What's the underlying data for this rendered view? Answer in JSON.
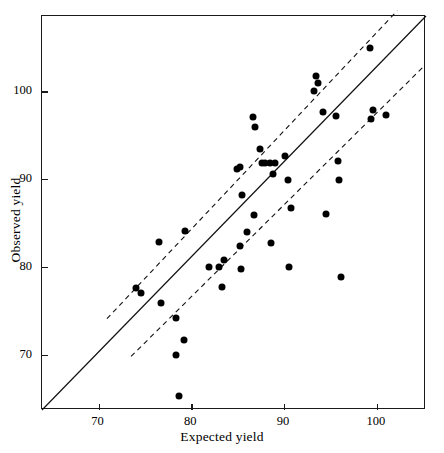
{
  "chart_data": {
    "type": "scatter",
    "title": "",
    "xlabel": "Expected yield",
    "ylabel": "Observed yield",
    "xlim": [
      63.9,
      105.3
    ],
    "ylim": [
      63.7,
      108.6
    ],
    "xticks": [
      70,
      80,
      90,
      100
    ],
    "yticks": [
      70,
      80,
      90,
      100
    ],
    "xticklabels": [
      "70",
      "80",
      "90",
      "100"
    ],
    "yticklabels": [
      "70",
      "80",
      "90",
      "100"
    ],
    "grid": false,
    "legend": null,
    "series": [
      {
        "name": "Observed vs expected yield",
        "marker": "filled-circle",
        "color": "#000000",
        "points": [
          [
            74.0,
            77.6
          ],
          [
            74.6,
            77.0
          ],
          [
            76.5,
            82.9
          ],
          [
            76.7,
            75.9
          ],
          [
            78.3,
            74.2
          ],
          [
            78.4,
            70.0
          ],
          [
            78.7,
            65.3
          ],
          [
            79.2,
            71.7
          ],
          [
            79.3,
            84.1
          ],
          [
            81.9,
            80.0
          ],
          [
            83.0,
            80.0
          ],
          [
            83.3,
            77.7
          ],
          [
            83.5,
            80.8
          ],
          [
            84.9,
            91.2
          ],
          [
            85.2,
            82.4
          ],
          [
            85.3,
            91.4
          ],
          [
            85.4,
            79.8
          ],
          [
            85.5,
            88.2
          ],
          [
            86.0,
            84.0
          ],
          [
            86.6,
            97.1
          ],
          [
            86.8,
            85.9
          ],
          [
            86.9,
            96.0
          ],
          [
            87.4,
            93.5
          ],
          [
            87.6,
            91.9
          ],
          [
            87.9,
            91.8
          ],
          [
            88.5,
            91.9
          ],
          [
            88.6,
            82.7
          ],
          [
            88.8,
            90.6
          ],
          [
            89.0,
            91.8
          ],
          [
            90.1,
            92.7
          ],
          [
            90.4,
            89.9
          ],
          [
            90.5,
            80.0
          ],
          [
            90.7,
            86.7
          ],
          [
            93.2,
            100.0
          ],
          [
            93.4,
            101.8
          ],
          [
            93.7,
            101.0
          ],
          [
            94.2,
            97.7
          ],
          [
            94.5,
            86.0
          ],
          [
            95.6,
            97.2
          ],
          [
            95.8,
            92.1
          ],
          [
            95.9,
            89.9
          ],
          [
            96.1,
            78.8
          ],
          [
            99.3,
            105.0
          ],
          [
            99.4,
            96.9
          ],
          [
            99.6,
            97.9
          ],
          [
            101.0,
            97.3
          ]
        ]
      }
    ],
    "reference_lines": [
      {
        "name": "identity-line",
        "style": "solid",
        "x1": 63.9,
        "y1": 63.7,
        "x2": 105.3,
        "y2": 108.6
      },
      {
        "name": "upper-limit-line",
        "style": "dashed",
        "x1": 70.9,
        "y1": 74.1,
        "x2": 102.2,
        "y2": 109.2
      },
      {
        "name": "lower-limit-line",
        "style": "dashed",
        "x1": 73.5,
        "y1": 69.8,
        "x2": 105.0,
        "y2": 102.8
      }
    ]
  }
}
